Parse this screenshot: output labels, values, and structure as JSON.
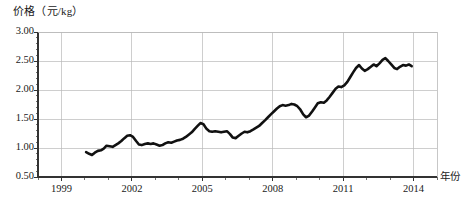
{
  "chart_data": {
    "type": "line",
    "title": "",
    "ylabel": "价格（元/kg）",
    "xlabel": "年份",
    "ylim": [
      0.5,
      3.0
    ],
    "xlim": [
      1998.0,
      2015.0
    ],
    "yticks": [
      "0.50",
      "1.00",
      "1.50",
      "2.00",
      "2.50",
      "3.00"
    ],
    "ytick_values": [
      0.5,
      1.0,
      1.5,
      2.0,
      2.5,
      3.0
    ],
    "xticks": [
      "1999",
      "2002",
      "2005",
      "2008",
      "2011",
      "2014"
    ],
    "xtick_values": [
      1999,
      2002,
      2005,
      2008,
      2011,
      2014
    ],
    "grid": true,
    "legend": "none",
    "line_color": "#111111",
    "grid_color": "#b9b9b9",
    "axis_color": "#333333",
    "series": [
      {
        "name": "价格",
        "x": [
          2000.05,
          2000.18,
          2000.3,
          2000.42,
          2000.55,
          2000.68,
          2000.8,
          2000.92,
          2001.05,
          2001.18,
          2001.3,
          2001.42,
          2001.55,
          2001.68,
          2001.8,
          2001.92,
          2002.05,
          2002.18,
          2002.3,
          2002.42,
          2002.55,
          2002.68,
          2002.8,
          2002.92,
          2003.05,
          2003.18,
          2003.3,
          2003.42,
          2003.55,
          2003.68,
          2003.8,
          2003.92,
          2004.05,
          2004.18,
          2004.3,
          2004.42,
          2004.55,
          2004.68,
          2004.8,
          2004.92,
          2005.05,
          2005.18,
          2005.3,
          2005.42,
          2005.55,
          2005.68,
          2005.8,
          2005.92,
          2006.05,
          2006.18,
          2006.3,
          2006.42,
          2006.55,
          2006.68,
          2006.8,
          2006.92,
          2007.05,
          2007.18,
          2007.3,
          2007.42,
          2007.55,
          2007.68,
          2007.8,
          2007.92,
          2008.05,
          2008.18,
          2008.3,
          2008.42,
          2008.55,
          2008.68,
          2008.8,
          2008.92,
          2009.05,
          2009.18,
          2009.3,
          2009.42,
          2009.55,
          2009.68,
          2009.8,
          2009.92,
          2010.05,
          2010.18,
          2010.3,
          2010.42,
          2010.55,
          2010.68,
          2010.8,
          2010.92,
          2011.05,
          2011.18,
          2011.3,
          2011.42,
          2011.55,
          2011.68,
          2011.8,
          2011.92,
          2012.05,
          2012.18,
          2012.3,
          2012.42,
          2012.55,
          2012.68,
          2012.8,
          2012.92,
          2013.05,
          2013.18,
          2013.3,
          2013.42,
          2013.55,
          2013.68,
          2013.8,
          2013.92
        ],
        "values": [
          0.93,
          0.9,
          0.88,
          0.92,
          0.95,
          0.96,
          0.99,
          1.04,
          1.03,
          1.02,
          1.05,
          1.08,
          1.12,
          1.17,
          1.21,
          1.22,
          1.19,
          1.12,
          1.06,
          1.05,
          1.07,
          1.08,
          1.07,
          1.08,
          1.06,
          1.04,
          1.05,
          1.08,
          1.1,
          1.09,
          1.11,
          1.13,
          1.14,
          1.16,
          1.19,
          1.23,
          1.27,
          1.33,
          1.38,
          1.43,
          1.41,
          1.33,
          1.29,
          1.28,
          1.29,
          1.28,
          1.27,
          1.28,
          1.29,
          1.24,
          1.18,
          1.17,
          1.21,
          1.25,
          1.28,
          1.27,
          1.29,
          1.32,
          1.35,
          1.38,
          1.43,
          1.48,
          1.53,
          1.58,
          1.63,
          1.68,
          1.72,
          1.74,
          1.73,
          1.74,
          1.76,
          1.75,
          1.72,
          1.66,
          1.58,
          1.53,
          1.56,
          1.63,
          1.7,
          1.77,
          1.79,
          1.78,
          1.82,
          1.88,
          1.95,
          2.02,
          2.06,
          2.05,
          2.08,
          2.14,
          2.22,
          2.3,
          2.38,
          2.43,
          2.37,
          2.33,
          2.36,
          2.4,
          2.44,
          2.41,
          2.46,
          2.52,
          2.55,
          2.5,
          2.44,
          2.38,
          2.36,
          2.4,
          2.43,
          2.42,
          2.44,
          2.41
        ]
      }
    ]
  },
  "axes": {
    "y_title": "价格（元/kg）",
    "x_title": "年份"
  }
}
